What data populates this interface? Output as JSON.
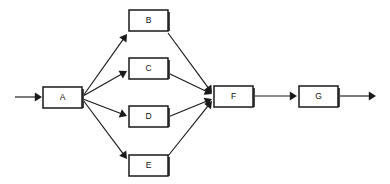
{
  "diagram": {
    "type": "flowchart",
    "background_color": "#ffffff",
    "line_color": "#1a1a1a",
    "node_fill_color": "#ffffff",
    "nodes": [
      {
        "id": "A",
        "label": "A",
        "x": 43,
        "y": 87,
        "w": 39,
        "h": 21
      },
      {
        "id": "B",
        "label": "B",
        "x": 129,
        "y": 10,
        "w": 39,
        "h": 21
      },
      {
        "id": "C",
        "label": "C",
        "x": 129,
        "y": 58,
        "w": 39,
        "h": 21
      },
      {
        "id": "D",
        "label": "D",
        "x": 129,
        "y": 106,
        "w": 39,
        "h": 21
      },
      {
        "id": "E",
        "label": "E",
        "x": 129,
        "y": 155,
        "w": 39,
        "h": 21
      },
      {
        "id": "F",
        "label": "F",
        "x": 214,
        "y": 86,
        "w": 39,
        "h": 21
      },
      {
        "id": "G",
        "label": "G",
        "x": 299,
        "y": 86,
        "w": 39,
        "h": 21
      }
    ],
    "edges": [
      {
        "id": "in-A",
        "from": "input",
        "to": "A",
        "x1": 15,
        "y1": 97,
        "x2": 42,
        "y2": 97
      },
      {
        "id": "A-B",
        "from": "A",
        "to": "B",
        "x1": 83,
        "y1": 96,
        "x2": 127,
        "y2": 34
      },
      {
        "id": "A-C",
        "from": "A",
        "to": "C",
        "x1": 83,
        "y1": 96,
        "x2": 127,
        "y2": 71
      },
      {
        "id": "A-D",
        "from": "A",
        "to": "D",
        "x1": 83,
        "y1": 99,
        "x2": 127,
        "y2": 116
      },
      {
        "id": "A-E",
        "from": "A",
        "to": "E",
        "x1": 83,
        "y1": 100,
        "x2": 127,
        "y2": 159
      },
      {
        "id": "B-F",
        "from": "B",
        "to": "F",
        "x1": 168,
        "y1": 33,
        "x2": 212,
        "y2": 93
      },
      {
        "id": "C-F",
        "from": "C",
        "to": "F",
        "x1": 168,
        "y1": 73,
        "x2": 212,
        "y2": 94
      },
      {
        "id": "D-F",
        "from": "D",
        "to": "F",
        "x1": 168,
        "y1": 117,
        "x2": 212,
        "y2": 99
      },
      {
        "id": "E-F",
        "from": "E",
        "to": "F",
        "x1": 168,
        "y1": 156,
        "x2": 212,
        "y2": 101
      },
      {
        "id": "F-G",
        "from": "F",
        "to": "G",
        "x1": 254,
        "y1": 96,
        "x2": 297,
        "y2": 96
      },
      {
        "id": "G-out",
        "from": "G",
        "to": "output",
        "x1": 339,
        "y1": 96,
        "x2": 376,
        "y2": 96
      }
    ]
  }
}
